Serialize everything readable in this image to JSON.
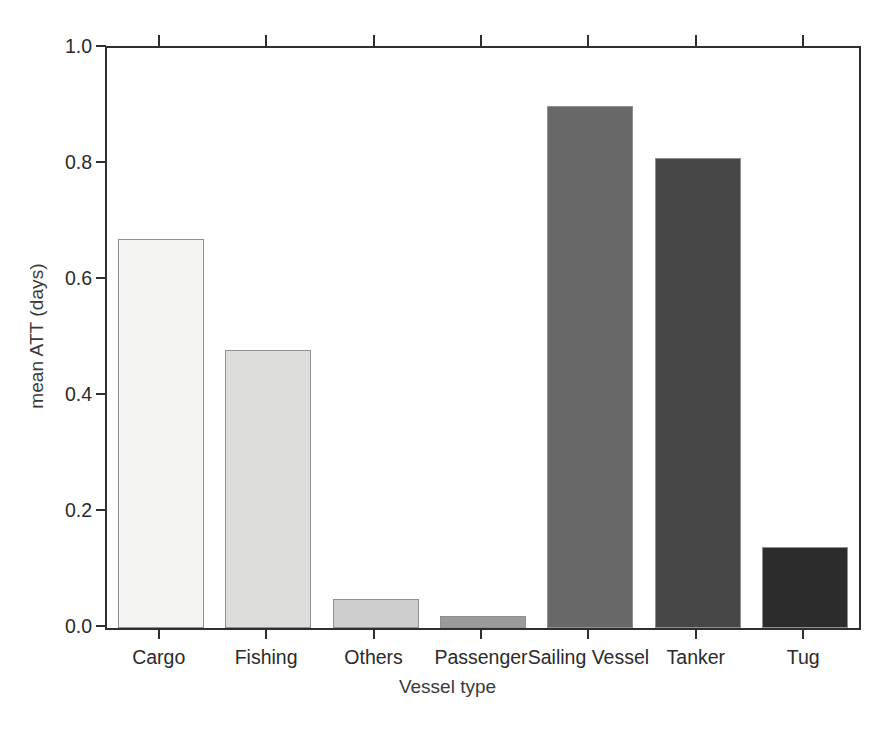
{
  "chart_data": {
    "type": "bar",
    "title": "",
    "subtitle": "",
    "xlabel": "Vessel type",
    "ylabel": "mean ATT (days)",
    "categories": [
      "Cargo",
      "Fishing",
      "Others",
      "Passenger",
      "Sailing Vessel",
      "Tanker",
      "Tug"
    ],
    "values": [
      0.67,
      0.48,
      0.05,
      0.02,
      0.9,
      0.81,
      0.14
    ],
    "ylim": [
      0.0,
      1.0
    ],
    "ytick_labels": [
      "0.0",
      "0.2",
      "0.4",
      "0.6",
      "0.8",
      "1.0"
    ],
    "ytick_values": [
      0.0,
      0.2,
      0.4,
      0.6,
      0.8,
      1.0
    ],
    "grid": false,
    "legend": "none",
    "bar_colors": [
      "#f4f4f3",
      "#dddddc",
      "#cecece",
      "#9b9b9b",
      "#686868",
      "#474747",
      "#2c2c2c"
    ],
    "bar_edge_color": "#8f8f8f",
    "axis_color": "#2f2f2f",
    "background_color": "#ffffff",
    "annotations": []
  }
}
